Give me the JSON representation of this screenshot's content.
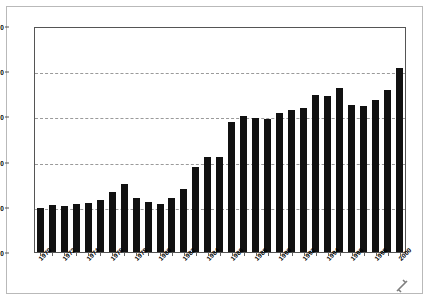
{
  "chart_data": {
    "type": "bar",
    "title": "",
    "subtitle": "",
    "xlabel": "",
    "ylabel": "",
    "ylim": [
      0,
      250
    ],
    "yticks": [
      0,
      50,
      100,
      150,
      200,
      250
    ],
    "gridlines": [
      50,
      100,
      150,
      200
    ],
    "grid": true,
    "legend": null,
    "bar_color": "#111111",
    "plot_background": "#ffffff",
    "gridline_color": "#9a9a9a",
    "axis_color": "#555555",
    "frame_color": "#b9b9b9",
    "xtick_label_rotation": -45,
    "xtick_label_interval": 2,
    "categories": [
      "1970",
      "1971",
      "1972",
      "1973",
      "1974",
      "1975",
      "1976",
      "1977",
      "1978",
      "1979",
      "1980",
      "1981",
      "1982",
      "1983",
      "1984",
      "1985",
      "1986",
      "1987",
      "1988",
      "1989",
      "1990",
      "1991",
      "1992",
      "1993",
      "1994",
      "1995",
      "1996",
      "1997",
      "1998",
      "1999",
      "2000"
    ],
    "tick_labels": [
      "1970",
      "1972",
      "1974",
      "1976",
      "1978",
      "1980",
      "1982",
      "1984",
      "1986",
      "1988",
      "1990",
      "1992",
      "1994",
      "1996",
      "1998",
      "2000"
    ],
    "values": [
      49,
      52,
      51,
      53,
      54,
      58,
      66,
      75,
      60,
      55,
      53,
      60,
      70,
      94,
      105,
      105,
      144,
      150,
      148,
      147,
      154,
      157,
      159,
      174,
      173,
      181,
      163,
      161,
      168,
      179,
      204
    ]
  }
}
